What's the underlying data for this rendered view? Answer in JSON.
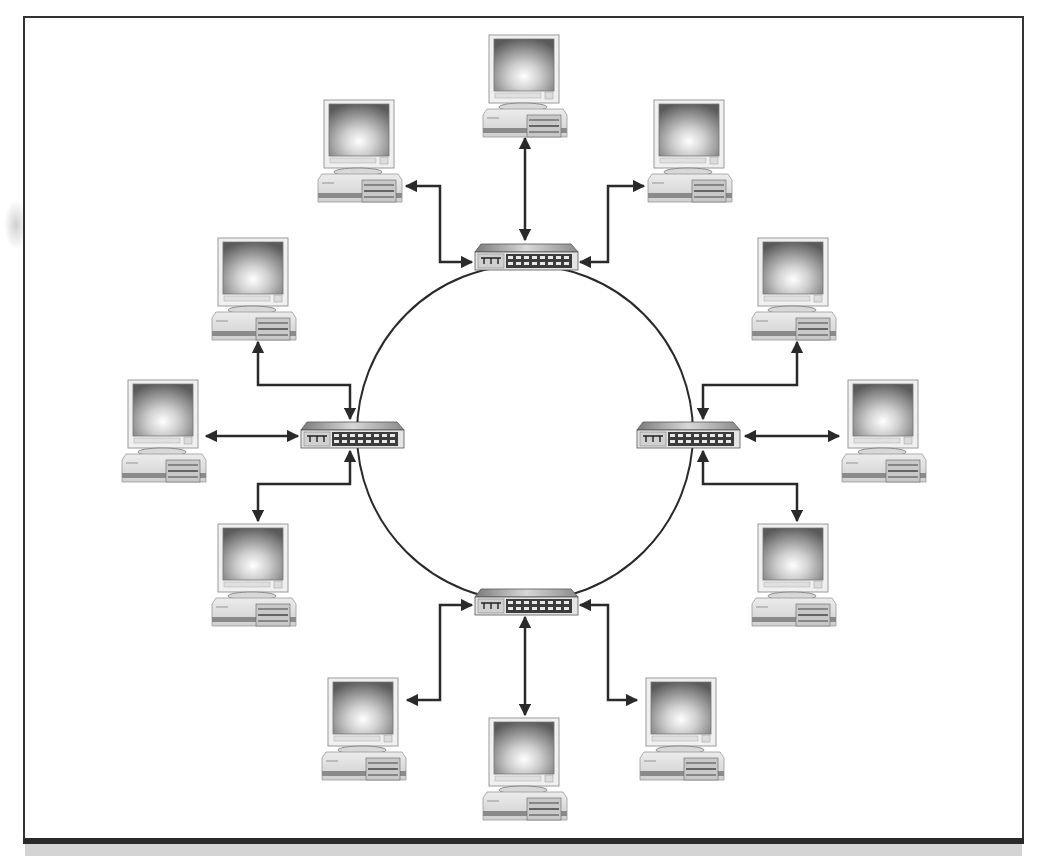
{
  "diagram": {
    "type": "network-topology",
    "ring": {
      "cx": 525,
      "cy": 433,
      "r": 168,
      "stroke": "#2a2a2a"
    },
    "colors": {
      "frame": "#333333",
      "link": "#2a2a2a",
      "footer": "#d4d4d4",
      "footer_border": "#2a2a2a"
    },
    "switches": [
      {
        "id": "switch-top",
        "x": 475,
        "y": 244
      },
      {
        "id": "switch-left",
        "x": 301,
        "y": 422
      },
      {
        "id": "switch-right",
        "x": 637,
        "y": 422
      },
      {
        "id": "switch-bottom",
        "x": 475,
        "y": 589
      }
    ],
    "computers": [
      {
        "id": "pc-top-center",
        "x": 483,
        "y": 35,
        "switch": "switch-top"
      },
      {
        "id": "pc-top-left",
        "x": 318,
        "y": 100,
        "switch": "switch-top"
      },
      {
        "id": "pc-top-right",
        "x": 648,
        "y": 100,
        "switch": "switch-top"
      },
      {
        "id": "pc-left-upper",
        "x": 212,
        "y": 238,
        "switch": "switch-left"
      },
      {
        "id": "pc-left-middle",
        "x": 122,
        "y": 380,
        "switch": "switch-left"
      },
      {
        "id": "pc-left-lower",
        "x": 212,
        "y": 524,
        "switch": "switch-left"
      },
      {
        "id": "pc-right-upper",
        "x": 752,
        "y": 238,
        "switch": "switch-right"
      },
      {
        "id": "pc-right-middle",
        "x": 842,
        "y": 380,
        "switch": "switch-right"
      },
      {
        "id": "pc-right-lower",
        "x": 752,
        "y": 524,
        "switch": "switch-right"
      },
      {
        "id": "pc-bottom-left",
        "x": 322,
        "y": 678,
        "switch": "switch-bottom"
      },
      {
        "id": "pc-bottom-center",
        "x": 483,
        "y": 718,
        "switch": "switch-bottom"
      },
      {
        "id": "pc-bottom-right",
        "x": 640,
        "y": 678,
        "switch": "switch-bottom"
      }
    ],
    "links": [
      {
        "id": "link-top-center",
        "points": [
          [
            525,
            138
          ],
          [
            525,
            240
          ]
        ]
      },
      {
        "id": "link-top-left",
        "points": [
          [
            406,
            186
          ],
          [
            440,
            186
          ],
          [
            440,
            262
          ],
          [
            472,
            262
          ]
        ]
      },
      {
        "id": "link-top-right",
        "points": [
          [
            644,
            186
          ],
          [
            608,
            186
          ],
          [
            608,
            262
          ],
          [
            580,
            262
          ]
        ]
      },
      {
        "id": "link-left-upper",
        "points": [
          [
            258,
            342
          ],
          [
            258,
            385
          ],
          [
            350,
            385
          ],
          [
            350,
            419
          ]
        ]
      },
      {
        "id": "link-left-middle",
        "points": [
          [
            206,
            436
          ],
          [
            298,
            436
          ]
        ]
      },
      {
        "id": "link-left-lower",
        "points": [
          [
            350,
            451
          ],
          [
            350,
            484
          ],
          [
            258,
            484
          ],
          [
            258,
            521
          ]
        ]
      },
      {
        "id": "link-right-upper",
        "points": [
          [
            797,
            342
          ],
          [
            797,
            385
          ],
          [
            703,
            385
          ],
          [
            703,
            419
          ]
        ]
      },
      {
        "id": "link-right-middle",
        "points": [
          [
            745,
            436
          ],
          [
            839,
            436
          ]
        ]
      },
      {
        "id": "link-right-lower",
        "points": [
          [
            703,
            451
          ],
          [
            703,
            484
          ],
          [
            797,
            484
          ],
          [
            797,
            521
          ]
        ]
      },
      {
        "id": "link-bottom-left",
        "points": [
          [
            472,
            605
          ],
          [
            440,
            605
          ],
          [
            440,
            700
          ],
          [
            407,
            700
          ]
        ]
      },
      {
        "id": "link-bottom-center",
        "points": [
          [
            525,
            617
          ],
          [
            525,
            715
          ]
        ]
      },
      {
        "id": "link-bottom-right",
        "points": [
          [
            580,
            605
          ],
          [
            608,
            605
          ],
          [
            608,
            700
          ],
          [
            637,
            700
          ]
        ]
      }
    ]
  }
}
